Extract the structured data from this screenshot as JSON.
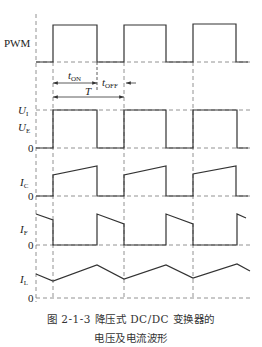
{
  "diagram": {
    "title_line1": "图 2-1-3   降压式 DC/DC 变换器的",
    "title_line2": "电压及电流波形",
    "signals": [
      {
        "name": "PWM",
        "label": "PWM"
      },
      {
        "name": "U_I",
        "label": "U",
        "sub": "I"
      },
      {
        "name": "U_E",
        "label": "U",
        "sub": "E"
      },
      {
        "name": "I_C",
        "label": "I",
        "sub": "C"
      },
      {
        "name": "I_F",
        "label": "I",
        "sub": "F"
      },
      {
        "name": "I_L",
        "label": "I",
        "sub": "L"
      }
    ],
    "zero_label": "0",
    "timing": {
      "t_on": {
        "label": "t",
        "sub": "ON"
      },
      "t_off": {
        "label": "t",
        "sub": "OFF"
      },
      "period": {
        "label": "T"
      }
    },
    "colors": {
      "line": "#333333",
      "dash": "#777777"
    }
  }
}
